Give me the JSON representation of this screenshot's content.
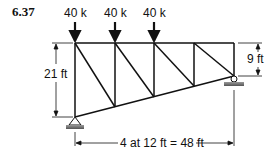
{
  "problem_number": "6.37",
  "loads": [
    {
      "label": "40 k",
      "joint": "top-1"
    },
    {
      "label": "40 k",
      "joint": "top-2"
    },
    {
      "label": "40 k",
      "joint": "top-3"
    }
  ],
  "dimensions": {
    "left_height": "21 ft",
    "right_height": "9 ft",
    "span": "4 at 12 ft = 48 ft"
  },
  "truss": {
    "panels": 4,
    "panel_width_ft": 12,
    "left_depth_ft": 21,
    "right_depth_ft": 9,
    "supports": {
      "left": "pin",
      "right": "roller"
    }
  },
  "colors": {
    "line": "#111111",
    "ground": "#777777"
  }
}
